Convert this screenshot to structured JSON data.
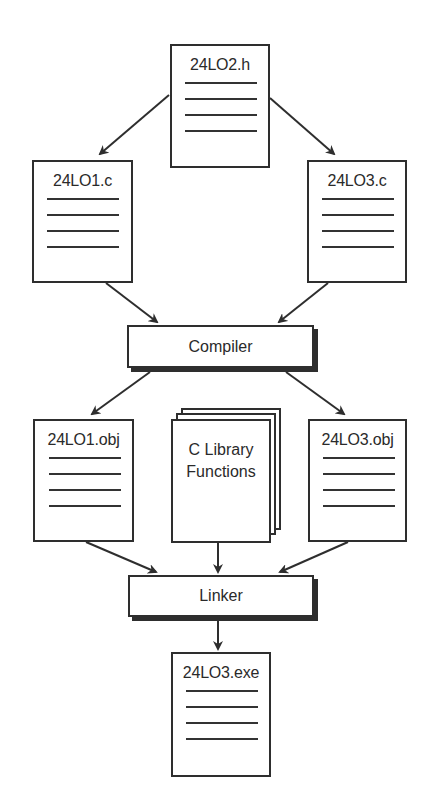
{
  "diagram": {
    "colors": {
      "stroke": "#2e2e2e",
      "background": "#ffffff",
      "text": "#2a2a2a"
    },
    "nodes": {
      "header": {
        "label": "24LO2.h",
        "type": "document"
      },
      "source1": {
        "label": "24LO1.c",
        "type": "document"
      },
      "source3": {
        "label": "24LO3.c",
        "type": "document"
      },
      "compiler": {
        "label": "Compiler",
        "type": "process"
      },
      "obj1": {
        "label": "24LO1.obj",
        "type": "document"
      },
      "library": {
        "label_line1": "C Library",
        "label_line2": "Functions",
        "type": "document-stack"
      },
      "obj3": {
        "label": "24LO3.obj",
        "type": "document"
      },
      "linker": {
        "label": "Linker",
        "type": "process"
      },
      "exe": {
        "label": "24LO3.exe",
        "type": "document"
      }
    },
    "edges": [
      {
        "from": "24LO2.h",
        "to": "24LO1.c"
      },
      {
        "from": "24LO2.h",
        "to": "24LO3.c"
      },
      {
        "from": "24LO1.c",
        "to": "Compiler"
      },
      {
        "from": "24LO3.c",
        "to": "Compiler"
      },
      {
        "from": "Compiler",
        "to": "24LO1.obj"
      },
      {
        "from": "Compiler",
        "to": "24LO3.obj"
      },
      {
        "from": "24LO1.obj",
        "to": "Linker"
      },
      {
        "from": "C Library Functions",
        "to": "Linker"
      },
      {
        "from": "24LO3.obj",
        "to": "Linker"
      },
      {
        "from": "Linker",
        "to": "24LO3.exe"
      }
    ]
  }
}
